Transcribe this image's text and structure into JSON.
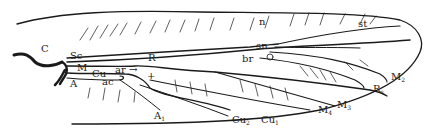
{
  "diagram": {
    "type": "insect-wing-venation",
    "colors": {
      "line": "#1a1a1a",
      "background": "#ffffff"
    },
    "labels": {
      "C": {
        "main": "C",
        "sub": ""
      },
      "Sc": {
        "main": "Sc",
        "sub": ""
      },
      "R": {
        "main": "R",
        "sub": ""
      },
      "M": {
        "main": "M",
        "sub": ""
      },
      "Cu": {
        "main": "Cu",
        "sub": ""
      },
      "A": {
        "main": "A",
        "sub": ""
      },
      "ar": {
        "main": "ar →",
        "sub": ""
      },
      "ac": {
        "main": "ac",
        "sub": ""
      },
      "t": {
        "main": "+",
        "sub": ""
      },
      "A1": {
        "main": "A",
        "sub": "1"
      },
      "n": {
        "main": "n",
        "sub": ""
      },
      "sn": {
        "main": "sn",
        "sub": ""
      },
      "br": {
        "main": "br",
        "sub": ""
      },
      "st": {
        "main": "st",
        "sub": ""
      },
      "M2": {
        "main": "M",
        "sub": "2"
      },
      "Rs": {
        "main": "R",
        "sub": "s"
      },
      "M3": {
        "main": "M",
        "sub": "3"
      },
      "M4": {
        "main": "M",
        "sub": "4"
      },
      "Cu2": {
        "main": "Cu",
        "sub": "2"
      },
      "Cu1": {
        "main": "Cu",
        "sub": "1"
      }
    }
  }
}
